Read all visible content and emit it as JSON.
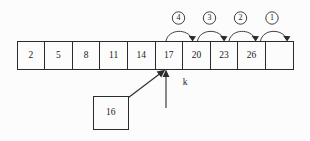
{
  "diagram": {
    "background_color": "#fcfcfc",
    "line_color": "#2b2b2b",
    "text_color": "#1a1a1a",
    "array": {
      "name": "sorted-array",
      "cells": [
        {
          "value": "2"
        },
        {
          "value": "5"
        },
        {
          "value": "8"
        },
        {
          "value": "11"
        },
        {
          "value": "14"
        },
        {
          "value": "17"
        },
        {
          "value": "20"
        },
        {
          "value": "23"
        },
        {
          "value": "26"
        },
        {
          "value": ""
        }
      ]
    },
    "steps": [
      {
        "label": "④",
        "order": "4"
      },
      {
        "label": "③",
        "order": "3"
      },
      {
        "label": "②",
        "order": "2"
      },
      {
        "label": "①",
        "order": "1"
      }
    ],
    "insert_value": {
      "value": "16"
    },
    "pointer": {
      "label": "k"
    }
  }
}
